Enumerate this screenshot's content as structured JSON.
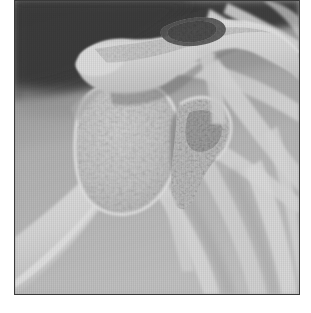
{
  "image": {
    "kind": "radiograph",
    "modality": "X-ray",
    "view": "anteroposterior-shoulder",
    "color_mode": "grayscale",
    "alt_text": "Grayscale anteroposterior radiograph of a right shoulder showing the humeral head, glenoid, acromion, distal clavicle and overlying ribs",
    "frame": {
      "x": 14,
      "y": 0,
      "width": 286,
      "height": 295,
      "border_color": "#3a3a3a",
      "border_width_px": 1
    },
    "margins": {
      "left_px": 14,
      "bottom_px": 18,
      "margin_color": "#ffffff"
    },
    "palette": {
      "background_soft_tissue_dark": "#2b2b2b",
      "soft_tissue_mid": "#8d8d8d",
      "soft_tissue_light": "#b6b6b6",
      "cancellous_bone": "#d8d8d8",
      "cortical_bone_bright": "#f2f2f2",
      "bone_peak_white": "#fdfdfd",
      "joint_space_dark": "#5a5a5a",
      "frame_border": "#3a3a3a",
      "page_background": "#ffffff"
    },
    "regions": [
      {
        "name": "upper-left-soft-tissue-shadow",
        "tone": "very-dark",
        "hex": "#2b2b2b",
        "note": "dark air/soft-tissue field occupying the top-left quadrant with a curved inferior border"
      },
      {
        "name": "acromion-and-distal-clavicle",
        "tone": "bright",
        "hex": "#f0f0f0",
        "note": "hook-shaped bright bone arching from upper-left-centre to the right"
      },
      {
        "name": "acromioclavicular-speckled-zone",
        "tone": "dark-mottled",
        "hex": "#4a4a4a",
        "note": "mottled darker patch on the superior margin of the distal clavicle"
      },
      {
        "name": "humeral-head",
        "tone": "light-mottled",
        "hex": "#dedede",
        "note": "large rounded trabecular mass left of centre"
      },
      {
        "name": "greater-tuberosity",
        "tone": "light",
        "hex": "#e4e4e4"
      },
      {
        "name": "humeral-shaft",
        "tone": "light",
        "hex": "#e8e8e8",
        "note": "tapering shaft running to the lower-left corner"
      },
      {
        "name": "glenoid-and-coracoid",
        "tone": "mid-light-mottled",
        "hex": "#cfcfcf",
        "note": "irregular trabecular block right of the humeral head"
      },
      {
        "name": "glenohumeral-joint-space",
        "tone": "dark",
        "hex": "#6b6b6b"
      },
      {
        "name": "upper-ribs",
        "tone": "bright-bands",
        "hex": "#ededed",
        "note": "diagonal rib bands crossing the right half of the film"
      },
      {
        "name": "lower-ribs-and-scapular-border",
        "tone": "bright-bands",
        "hex": "#f0f0f0",
        "note": "converging bright bands in the lower-right quadrant"
      },
      {
        "name": "thoracic-field",
        "tone": "mid",
        "hex": "#c4c4c4",
        "note": "broad light-grey lung/chest field filling the lower-centre"
      }
    ],
    "texture": {
      "film_grain": true,
      "vertical_scan_lines": true,
      "grain_opacity": 0.3
    }
  }
}
